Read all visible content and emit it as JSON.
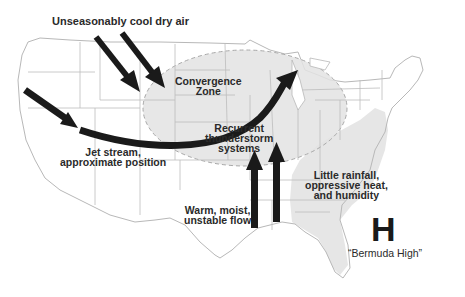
{
  "diagram": {
    "type": "weather-pattern-map",
    "region": "Contiguous United States",
    "colors": {
      "background": "#ffffff",
      "state_lines": "#b8b8b8",
      "shaded_zone": "#e6e6e6",
      "zone_border": "#a8a8a8",
      "arrows": "#1a1a1a",
      "text": "#2a2a2a"
    },
    "labels": {
      "cool_air": "Unseasonably cool dry air",
      "convergence": "Convergence\nZone",
      "thunderstorms": "Recurrent\nthunderstorm\nsystems",
      "jet_stream": "Jet stream,\napproximate position",
      "warm_flow": "Warm, moist,\nunstable flow",
      "southeast": "Little rainfall,\noppressive heat,\nand humidity",
      "high_symbol": "H",
      "high_name": "“Bermuda High”"
    },
    "arrows": [
      {
        "name": "cool-air-arrow-1",
        "direction": "southeast",
        "from": "northwest",
        "to": "northern plains"
      },
      {
        "name": "cool-air-arrow-2",
        "direction": "southeast",
        "from": "northwest",
        "to": "northern plains"
      },
      {
        "name": "jet-stream-arrow",
        "direction": "east then northeast",
        "path": "Pacific Northwest to Great Lakes"
      },
      {
        "name": "warm-flow-arrow-1",
        "direction": "north",
        "from": "Gulf of Mexico"
      },
      {
        "name": "warm-flow-arrow-2",
        "direction": "north",
        "from": "Gulf of Mexico"
      }
    ],
    "regions": [
      {
        "name": "convergence-zone",
        "shape": "ellipse",
        "location": "Central/Northern Plains to Great Lakes"
      },
      {
        "name": "southeast-heat-zone",
        "shape": "polygon",
        "location": "Southeast US incl. Florida"
      }
    ]
  }
}
